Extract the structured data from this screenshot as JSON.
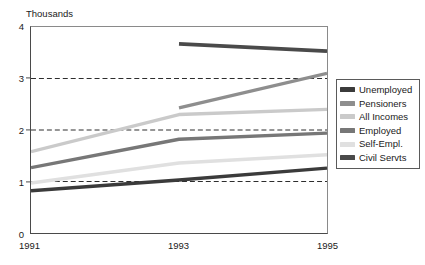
{
  "chart_data": {
    "type": "line",
    "title": "",
    "subtitle": "",
    "xlabel": "",
    "ylabel": "Thousands",
    "axis_title": "Thousands",
    "x": [
      1991,
      1993,
      1995
    ],
    "xticklabels": [
      "1991",
      "1993",
      "1995"
    ],
    "yticklabels": [
      "0",
      "1",
      "2",
      "3",
      "4"
    ],
    "ytickvalues": [
      0,
      1,
      2,
      3,
      4
    ],
    "xlim": [
      1991,
      1995
    ],
    "ylim": [
      0,
      4
    ],
    "grid": "horizontal-dashed",
    "gridlines": [
      1,
      2,
      3
    ],
    "legend_position": "right-middle",
    "series": [
      {
        "name": "Unemployed",
        "color": "#3b3b3b",
        "width": 3.4,
        "x": [
          1991,
          1993,
          1995
        ],
        "values": [
          0.82,
          1.03,
          1.26
        ]
      },
      {
        "name": "Pensioners",
        "color": "#8e8e8e",
        "width": 3.4,
        "x": [
          1993,
          1995
        ],
        "values": [
          2.43,
          3.1
        ]
      },
      {
        "name": "All Incomes",
        "color": "#cacaca",
        "width": 3.4,
        "x": [
          1991,
          1993,
          1995
        ],
        "values": [
          1.58,
          2.3,
          2.4
        ]
      },
      {
        "name": "Employed",
        "color": "#777777",
        "width": 3.4,
        "x": [
          1991,
          1993,
          1995
        ],
        "values": [
          1.27,
          1.82,
          1.94
        ]
      },
      {
        "name": "Self-Empl.",
        "color": "#e0e0e0",
        "width": 3.4,
        "x": [
          1991,
          1993,
          1995
        ],
        "values": [
          0.97,
          1.36,
          1.52
        ]
      },
      {
        "name": "Civil Servts",
        "color": "#4a4a4a",
        "width": 3.8,
        "x": [
          1993,
          1995
        ],
        "values": [
          3.67,
          3.53
        ]
      }
    ]
  },
  "legend": {
    "items": [
      {
        "label": "Unemployed",
        "color": "#3b3b3b"
      },
      {
        "label": "Pensioners",
        "color": "#8e8e8e"
      },
      {
        "label": "All Incomes",
        "color": "#cacaca"
      },
      {
        "label": "Employed",
        "color": "#777777"
      },
      {
        "label": "Self-Empl.",
        "color": "#e0e0e0"
      },
      {
        "label": "Civil Servts",
        "color": "#4a4a4a"
      }
    ]
  },
  "style": {
    "axis_color": "#4a4a4a",
    "grid_color": "#2b2b2b",
    "text_color": "#1a1a1a",
    "background": "#ffffff"
  }
}
